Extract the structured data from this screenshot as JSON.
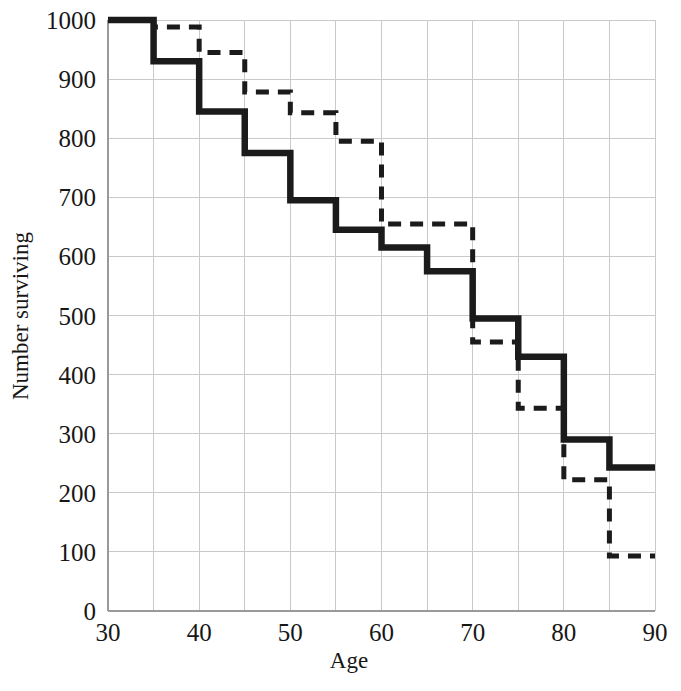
{
  "chart_data": {
    "type": "line",
    "subtype": "step-post",
    "title": "",
    "subtitle": "",
    "xlabel": "Age",
    "ylabel": "Number surviving",
    "xlim": [
      30,
      90
    ],
    "ylim": [
      0,
      1000
    ],
    "grid": true,
    "legend": "none",
    "xticks": [
      30,
      40,
      50,
      60,
      70,
      80,
      90
    ],
    "xtick_labels": [
      "30",
      "40",
      "50",
      "60",
      "70",
      "80",
      "90"
    ],
    "yticks": [
      0,
      100,
      200,
      300,
      400,
      500,
      600,
      700,
      800,
      900,
      1000
    ],
    "ytick_labels": [
      "0",
      "100",
      "200",
      "300",
      "400",
      "500",
      "600",
      "700",
      "800",
      "900",
      "1000"
    ],
    "x_minor_gridlines": [
      35,
      45,
      55,
      65,
      75,
      85
    ],
    "x": [
      30,
      35,
      40,
      45,
      50,
      55,
      60,
      65,
      70,
      75,
      80,
      85,
      90
    ],
    "series": [
      {
        "name": "solid-cohort",
        "style": "solid",
        "color": "#1b1b1b",
        "values": [
          1000,
          930,
          845,
          775,
          695,
          645,
          615,
          575,
          495,
          430,
          290,
          243,
          243
        ]
      },
      {
        "name": "dashed-cohort",
        "style": "dashed",
        "color": "#1b1b1b",
        "values": [
          1000,
          988,
          945,
          878,
          843,
          795,
          655,
          655,
          455,
          343,
          222,
          93,
          93
        ]
      }
    ],
    "annotations": []
  },
  "axes": {
    "x_title": "Age",
    "y_title": "Number surviving"
  }
}
